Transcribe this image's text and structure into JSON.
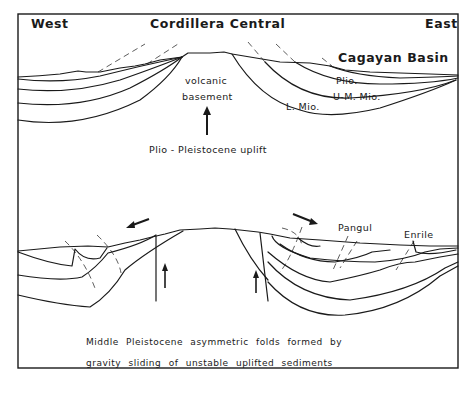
{
  "header": {
    "west": "West",
    "title": "Cordillera Central",
    "east": "East",
    "basin": "Cagayan Basin"
  },
  "upper_section": {
    "units": [
      "Plio.",
      "U-M. Mio.",
      "L. Mio."
    ],
    "core_label_1": "volcanic",
    "core_label_2": "basement",
    "uplift_label": "Plio - Pleistocene uplift"
  },
  "lower_section": {
    "localities": [
      "Pangul",
      "Enrile"
    ],
    "caption_line_1": "Middle Pleistocene asymmetric folds formed by",
    "caption_line_2": "gravity sliding of unstable uplifted sediments"
  }
}
